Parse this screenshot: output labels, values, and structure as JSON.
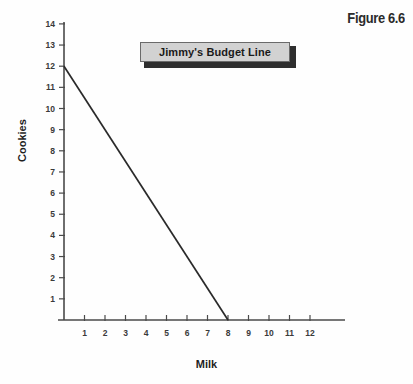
{
  "figure": {
    "number_label": "Figure 6.6",
    "background_color": "#fefefe"
  },
  "title_plate": {
    "label": "Jimmy's Budget Line",
    "fill_color": "#d2d2d2",
    "border_color": "#6a6a6a",
    "shadow_color": "#2e2e2e"
  },
  "chart_data": {
    "type": "line",
    "title": "Jimmy's Budget Line",
    "xlabel": "Milk",
    "ylabel": "Cookies",
    "xlim": [
      0,
      13.7
    ],
    "ylim": [
      0,
      14
    ],
    "grid": false,
    "legend": null,
    "x_ticks": [
      1,
      2,
      3,
      4,
      5,
      6,
      7,
      8,
      9,
      10,
      11,
      12
    ],
    "x_tick_labels": [
      "1",
      "2",
      "3",
      "4",
      "5",
      "6",
      "7",
      "8",
      "9",
      "10",
      "11",
      "12"
    ],
    "y_ticks": [
      1,
      2,
      3,
      4,
      5,
      6,
      7,
      8,
      9,
      10,
      11,
      12,
      13,
      14
    ],
    "y_tick_labels": [
      "1",
      "2",
      "3",
      "4",
      "5",
      "6",
      "7",
      "8",
      "9",
      "10",
      "11",
      "12",
      "13",
      "14"
    ],
    "series": [
      {
        "name": "Jimmy's Budget Line",
        "color": "#2a2a2a",
        "x": [
          0,
          8
        ],
        "y": [
          12,
          0
        ],
        "endpoints": {
          "y_intercept": 12,
          "x_intercept": 8,
          "slope": -1.5
        }
      }
    ],
    "axis_color": "#4a4a4a"
  },
  "geometry": {
    "origin_x_px": 64,
    "origin_y_px": 320,
    "x_unit_px": 20.5,
    "y_unit_px": 21.15,
    "x_axis_end_px": 345,
    "y_axis_top_px": 22
  }
}
